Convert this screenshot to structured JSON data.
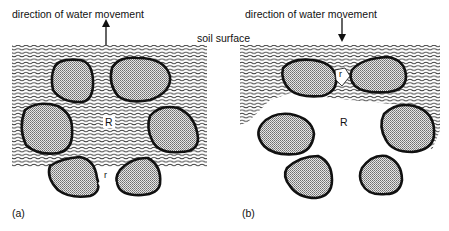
{
  "panel_a": {
    "title": "direction of water movement",
    "arrow_direction": "up",
    "large_pore_label": "R",
    "small_pore_label": "r",
    "caption": "(a)"
  },
  "panel_b": {
    "title": "direction of water movement",
    "arrow_direction": "down",
    "large_pore_label": "R",
    "small_pore_label": "r",
    "caption": "(b)"
  },
  "shared": {
    "soil_surface_label": "soil surface"
  },
  "colors": {
    "water_line": "#3a3a3a",
    "particle_fill": "#bdbdbd",
    "particle_outline": "#111111"
  }
}
